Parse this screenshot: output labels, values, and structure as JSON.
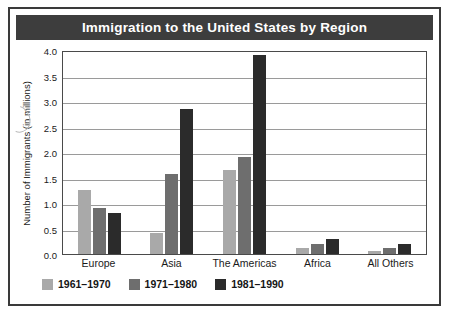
{
  "chart_data": {
    "type": "bar",
    "title": "Immigration to the United States by Region",
    "xlabel": "",
    "ylabel": "Number of Immigrants (in millions)",
    "categories": [
      "Europe",
      "Asia",
      "The Americas",
      "Africa",
      "All Others"
    ],
    "series": [
      {
        "name": "1961–1970",
        "color": "#a9a9a9",
        "values": [
          1.25,
          0.42,
          1.65,
          0.12,
          0.06
        ]
      },
      {
        "name": "1971–1980",
        "color": "#6e6e6e",
        "values": [
          0.9,
          1.56,
          1.9,
          0.2,
          0.11
        ]
      },
      {
        "name": "1981–1990",
        "color": "#2b2b2b",
        "values": [
          0.8,
          2.85,
          3.9,
          0.3,
          0.2
        ]
      }
    ],
    "ylim": [
      0.0,
      4.0
    ],
    "yticks": [
      "0.0",
      "0.5",
      "1.0",
      "1.5",
      "2.0",
      "2.5",
      "3.0",
      "3.5",
      "4.0"
    ],
    "ytick_values": [
      0.0,
      0.5,
      1.0,
      1.5,
      2.0,
      2.5,
      3.0,
      3.5,
      4.0
    ],
    "grid": true,
    "legend_position": "bottom-left"
  },
  "colors": {
    "title_bar": "#3d3d3d",
    "title_text": "#ffffff",
    "frame": "#3a3a3a",
    "plot_border": "#4a4a4a",
    "gridline": "#9a9a9a"
  }
}
